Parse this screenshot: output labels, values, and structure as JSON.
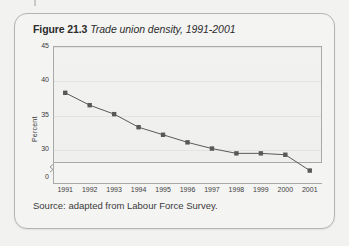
{
  "figure": {
    "number_label": "Figure 21.3",
    "title": "Trade union density, 1991-2001",
    "source": "Source: adapted from Labour Force Survey."
  },
  "colors": {
    "card_background": "#f4f4f3",
    "card_border": "#b4b4b2",
    "page_background": "#f2f2f1",
    "series_line": "#5a5a5a",
    "series_marker": "#585858",
    "axis": "#a9a9a7",
    "gridline": "#e3e3e1",
    "text": "#3a3a3a"
  },
  "chart_data": {
    "type": "line",
    "title": "Trade union density, 1991-2001",
    "xlabel": "",
    "ylabel": "Percent",
    "categories": [
      "1991",
      "1992",
      "1993",
      "1994",
      "1995",
      "1996",
      "1997",
      "1998",
      "1999",
      "2000",
      "2001"
    ],
    "values": [
      38.2,
      36.4,
      35.1,
      33.2,
      32.1,
      31.0,
      30.1,
      29.4,
      29.4,
      29.2,
      26.9
    ],
    "series": [
      {
        "name": "Trade union density",
        "values": [
          38.2,
          36.4,
          35.1,
          33.2,
          32.1,
          31.0,
          30.1,
          29.4,
          29.4,
          29.2,
          26.9
        ]
      }
    ],
    "ylim": [
      28,
      45
    ],
    "y_ticks": [
      "45",
      "40",
      "35",
      "30"
    ],
    "y_zero_tick": "0",
    "y_axis_break": true,
    "grid": true,
    "legend": "none",
    "marker": "square"
  }
}
